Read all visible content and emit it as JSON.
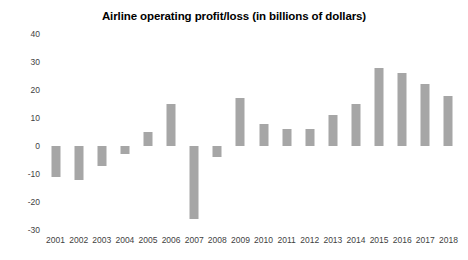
{
  "chart_data": {
    "type": "bar",
    "title": "Airline operating profit/loss (in billions of dollars)",
    "subtitle": "",
    "xlabel": "",
    "ylabel": "",
    "categories": [
      "2001",
      "2002",
      "2003",
      "2004",
      "2005",
      "2006",
      "2007",
      "2008",
      "2009",
      "2010",
      "2011",
      "2012",
      "2013",
      "2014",
      "2015",
      "2016",
      "2017",
      "2018"
    ],
    "values": [
      -11,
      -12,
      -7,
      -3,
      5,
      15,
      -26,
      -4,
      17,
      8,
      6,
      6,
      11,
      15,
      28,
      26,
      22,
      18
    ],
    "ylim": [
      -30,
      40
    ],
    "yticks": [
      40,
      30,
      20,
      10,
      0,
      -10,
      -20,
      -30
    ],
    "ytick_labels": [
      "40",
      "30",
      "20",
      "10",
      "0",
      "-10",
      "-20",
      "-30"
    ],
    "grid": false,
    "legend": null,
    "legend_position": "none",
    "bar_color": "#a6a6a6",
    "text_color": "#3f3f3f",
    "title_color": "#000000",
    "background": "#ffffff"
  }
}
